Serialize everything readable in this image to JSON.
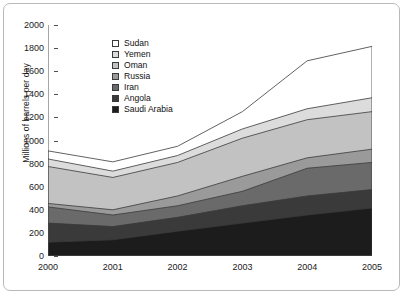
{
  "chart_data": {
    "type": "area",
    "stacked": true,
    "title": "",
    "xlabel": "",
    "ylabel": "Millions of barrels per day",
    "x": [
      "2000",
      "2001",
      "2002",
      "2003",
      "2004",
      "2005"
    ],
    "xtick_labels": [
      "2000",
      "2001",
      "2002",
      "2003",
      "2004",
      "2005"
    ],
    "ytick_labels": [
      "0",
      "200",
      "400",
      "600",
      "800",
      "1000",
      "1200",
      "1400",
      "1600",
      "1800",
      "2000"
    ],
    "ylim": [
      0,
      2000
    ],
    "ytick_step": 200,
    "grid": false,
    "legend_position": "upper-left-inside",
    "stack_order_bottom_to_top": [
      "Saudi Arabia",
      "Angola",
      "Iran",
      "Russia",
      "Oman",
      "Yemen",
      "Sudan"
    ],
    "legend_entries": [
      "Sudan",
      "Yemen",
      "Oman",
      "Russia",
      "Iran",
      "Angola",
      "Saudi Arabia"
    ],
    "series": [
      {
        "name": "Saudi Arabia",
        "color": "#1c1c1c",
        "values": [
          120,
          140,
          215,
          285,
          355,
          415
        ]
      },
      {
        "name": "Angola",
        "color": "#3a3a3a",
        "values": [
          165,
          115,
          120,
          150,
          165,
          160
        ]
      },
      {
        "name": "Iran",
        "color": "#6a6a6a",
        "values": [
          140,
          100,
          100,
          125,
          240,
          235
        ]
      },
      {
        "name": "Russia",
        "color": "#9a9a9a",
        "values": [
          30,
          45,
          85,
          130,
          90,
          115
        ]
      },
      {
        "name": "Oman",
        "color": "#c2c2c2",
        "values": [
          320,
          280,
          290,
          330,
          330,
          325
        ]
      },
      {
        "name": "Yemen",
        "color": "#dcdcdc",
        "values": [
          65,
          55,
          60,
          80,
          95,
          120
        ]
      },
      {
        "name": "Sudan",
        "color": "#ffffff",
        "values": [
          70,
          80,
          80,
          150,
          415,
          445
        ]
      }
    ],
    "cumulative_tops": {
      "Saudi Arabia": [
        120,
        140,
        215,
        285,
        355,
        415
      ],
      "Angola": [
        285,
        255,
        335,
        435,
        520,
        575
      ],
      "Iran": [
        425,
        355,
        435,
        560,
        760,
        810
      ],
      "Russia": [
        455,
        400,
        520,
        690,
        850,
        925
      ],
      "Oman": [
        775,
        680,
        810,
        1020,
        1180,
        1250
      ],
      "Yemen": [
        840,
        735,
        870,
        1100,
        1275,
        1370
      ],
      "Sudan": [
        910,
        815,
        950,
        1250,
        1690,
        1815
      ]
    },
    "totals": [
      910,
      815,
      950,
      1250,
      1690,
      1815
    ]
  },
  "style": {
    "axis_color": "#4d4d4d",
    "text_color": "#1a1a1a",
    "frame_color": "#b9b9b9",
    "background": "#ffffff",
    "outline_color": "#3a3a3a"
  }
}
